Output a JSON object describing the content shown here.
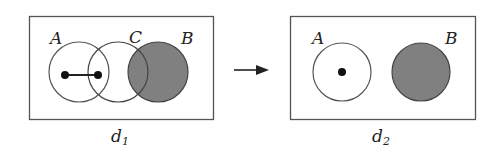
{
  "diagram": {
    "arrow": "right-arrow",
    "colors": {
      "line": "#555555",
      "shade": "#808080",
      "dot": "#111111",
      "background": "#ffffff"
    },
    "panels": [
      {
        "name": "d1",
        "caption_main": "d",
        "caption_sub": "1",
        "circles": [
          {
            "label": "A",
            "shaded": false
          },
          {
            "label": "C",
            "shaded": false
          },
          {
            "label": "B",
            "shaded": true
          }
        ],
        "points": 2,
        "connected_by_line": true
      },
      {
        "name": "d2",
        "caption_main": "d",
        "caption_sub": "2",
        "circles": [
          {
            "label": "A",
            "shaded": false
          },
          {
            "label": "B",
            "shaded": true
          }
        ],
        "points": 1,
        "connected_by_line": false
      }
    ]
  }
}
